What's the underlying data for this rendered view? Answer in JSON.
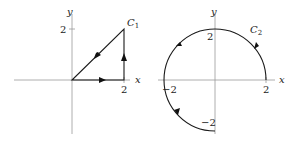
{
  "figure": {
    "panels": [
      {
        "id": "left",
        "curve_name": "C",
        "curve_subscript": "1",
        "x_axis_label": "x",
        "y_axis_label": "y",
        "tick_labels": {
          "x_tick": "2",
          "y_tick": "2"
        },
        "shape": "triangle",
        "vertices": [
          [
            0,
            0
          ],
          [
            2,
            0
          ],
          [
            2,
            2
          ]
        ],
        "orientation": "counterclockwise"
      },
      {
        "id": "right",
        "curve_name": "C",
        "curve_subscript": "2",
        "x_axis_label": "x",
        "y_axis_label": "y",
        "tick_labels": {
          "x_pos": "2",
          "x_neg": "−2",
          "y_pos": "2",
          "y_neg": "−2"
        },
        "shape": "circular arc",
        "radius": 2,
        "start_point": [
          2,
          0
        ],
        "end_point": [
          0,
          -2
        ],
        "orientation": "counterclockwise"
      }
    ]
  }
}
